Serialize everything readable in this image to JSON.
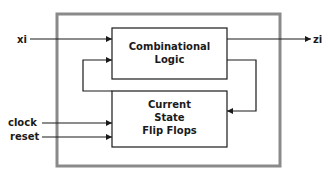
{
  "diagram": {
    "type": "sequential-circuit-block-diagram",
    "colors": {
      "outer_border": "#8a8a8a",
      "line": "#1a1a1a",
      "background": "#ffffff"
    },
    "blocks": {
      "combinational": {
        "line1": "Combinational",
        "line2": "Logic"
      },
      "state": {
        "line1": "Current",
        "line2": "State",
        "line3": "Flip Flops"
      }
    },
    "inputs": {
      "xi": "xi",
      "clock": "clock",
      "reset": "reset"
    },
    "outputs": {
      "zi": "zi"
    },
    "connections": [
      {
        "from": "xi",
        "to": "Combinational Logic"
      },
      {
        "from": "Current State Flip Flops",
        "to": "Combinational Logic"
      },
      {
        "from": "Combinational Logic",
        "to": "zi"
      },
      {
        "from": "Combinational Logic",
        "to": "Current State Flip Flops"
      },
      {
        "from": "clock",
        "to": "Current State Flip Flops"
      },
      {
        "from": "reset",
        "to": "Current State Flip Flops"
      }
    ]
  }
}
